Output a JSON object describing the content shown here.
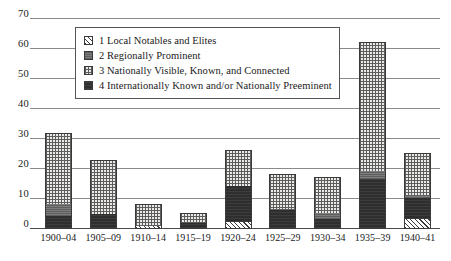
{
  "chart_data": {
    "type": "bar",
    "stacked": true,
    "title": "",
    "xlabel": "",
    "ylabel": "",
    "ylim": [
      0,
      70
    ],
    "ytick_step": 10,
    "yticks": [
      "70",
      "60",
      "50",
      "40",
      "30",
      "20",
      "10",
      "0"
    ],
    "grid": true,
    "legend_position": "top-center-inside",
    "categories": [
      "1900–04",
      "1905–09",
      "1910–14",
      "1915–19",
      "1920–24",
      "1925–29",
      "1930–34",
      "1935–39",
      "1940–41"
    ],
    "series": [
      {
        "name": "1 Local Notables and Elites",
        "key": "p1",
        "values": [
          0,
          0,
          1.0,
          0,
          2.3,
          0,
          0,
          0,
          3.3
        ]
      },
      {
        "name": "2 Regionally Prominent",
        "key": "p2",
        "values": [
          4.0,
          0,
          0,
          0,
          0,
          0.5,
          2.0,
          2.7,
          0.7
        ]
      },
      {
        "name": "3 Nationally Visible, Known, and Connected",
        "key": "p3",
        "values": [
          23.5,
          18.0,
          7.3,
          3.3,
          11.8,
          11.5,
          12.0,
          43.0,
          14.3
        ]
      },
      {
        "name": "4 Internationally Known and/or Nationally Preeminent",
        "key": "p4",
        "values": [
          4.5,
          5.0,
          0,
          2.0,
          12.2,
          6.3,
          3.3,
          16.8,
          7.2
        ]
      }
    ],
    "totals": [
      32.0,
      23.0,
      8.3,
      5.3,
      26.3,
      18.3,
      17.3,
      62.5,
      25.5
    ],
    "stack_order_bottom_to_top": [
      "p1",
      "p4",
      "p2",
      "p3",
      "p2"
    ],
    "colors": {
      "hatch": "#3b3b3b",
      "grey": "#6e6e6e",
      "dotted": "#eceae6",
      "dark": "#2e2e2e",
      "gridline": "#8a8a8a",
      "axis": "#4a4a4a",
      "text": "#1a1a1a",
      "background": "#ffffff"
    }
  },
  "legend": {
    "items": [
      {
        "label": "1 Local Notables and Elites",
        "pattern": "p1"
      },
      {
        "label": "2 Regionally Prominent",
        "pattern": "p2"
      },
      {
        "label": "3 Nationally Visible, Known, and Connected",
        "pattern": "p3"
      },
      {
        "label": "4 Internationally Known and/or Nationally Preeminent",
        "pattern": "p4"
      }
    ]
  }
}
